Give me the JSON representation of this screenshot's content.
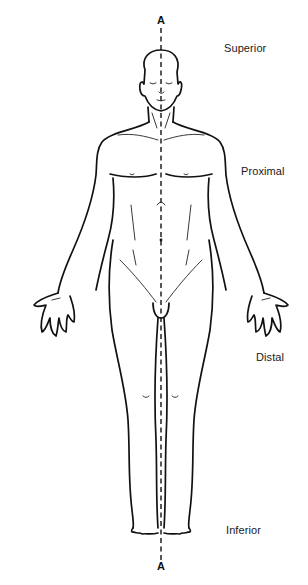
{
  "figure": {
    "axis": {
      "top_label": "A",
      "bottom_label": "A"
    },
    "labels": {
      "superior": "Superior",
      "proximal": "Proximal",
      "distal": "Distal",
      "inferior": "Inferior"
    },
    "colors": {
      "line": "#111111",
      "background": "#ffffff",
      "text": "#1a1a1a"
    }
  }
}
